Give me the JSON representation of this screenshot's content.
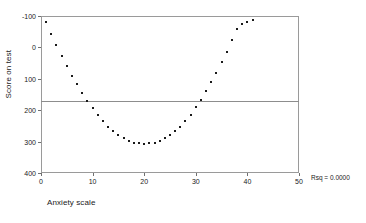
{
  "chart_data": {
    "type": "scatter",
    "title": "",
    "xlabel": "Anxiety scale",
    "ylabel": "Score on test",
    "xlim": [
      0,
      50
    ],
    "ylim": [
      -100,
      400
    ],
    "xticks": [
      0,
      10,
      20,
      30,
      40,
      50
    ],
    "yticks": [
      -100,
      0,
      100,
      200,
      300,
      400
    ],
    "grid": false,
    "legend": null,
    "annotations": [
      {
        "name": "rsq",
        "text": "Rsq = 0.0000",
        "value": 0.0
      }
    ],
    "reference_line": {
      "type": "horizontal",
      "label": "regression line",
      "y": 130,
      "color": "#8d8d8d"
    },
    "series": [
      {
        "name": "Score on test",
        "marker": "square",
        "color": "#1a1a1a",
        "x": [
          1,
          2,
          3,
          4,
          5,
          6,
          7,
          8,
          9,
          10,
          11,
          12,
          13,
          14,
          15,
          16,
          17,
          18,
          19,
          20,
          21,
          22,
          23,
          24,
          25,
          26,
          27,
          28,
          29,
          30,
          31,
          32,
          33,
          34,
          35,
          36,
          37,
          38,
          39,
          40,
          41
        ],
        "y": [
          380,
          342,
          308,
          272,
          240,
          210,
          182,
          156,
          130,
          107,
          86,
          66,
          48,
          33,
          20,
          10,
          2,
          -3,
          -6,
          -7,
          -6,
          -3,
          2,
          10,
          20,
          33,
          48,
          66,
          86,
          109,
          133,
          160,
          190,
          220,
          252,
          286,
          322,
          358,
          375,
          381,
          386
        ]
      }
    ]
  },
  "axes": {
    "y_tick_labels": [
      "400",
      "300",
      "200",
      "100",
      "0",
      "-100"
    ],
    "x_tick_labels": [
      "0",
      "10",
      "20",
      "30",
      "40",
      "50"
    ],
    "y_title": "Score on test",
    "x_title": "Anxiety scale"
  },
  "footnote": {
    "rsq_label": "Rsq = 0.0000"
  }
}
